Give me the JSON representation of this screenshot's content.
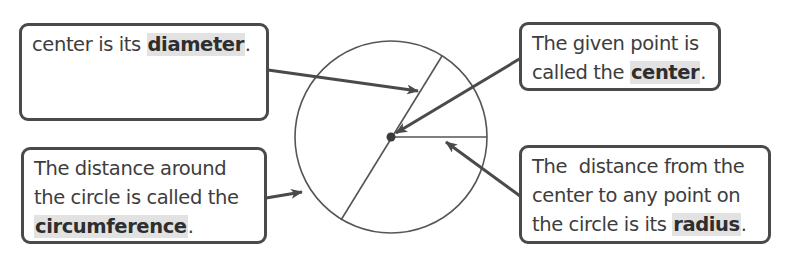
{
  "diagram": {
    "colors": {
      "stroke": "#4a4a4a",
      "highlight": "#e2e2e2",
      "text": "#3d3d3d"
    },
    "circle": {
      "cx": 391,
      "cy": 137,
      "r": 96
    },
    "callouts": {
      "diameter": {
        "lines": [
          "The distance across",
          "the circle through its",
          "center is its "
        ],
        "term": "diameter",
        "end": "."
      },
      "center": {
        "lines": [
          "The given point is",
          "called the "
        ],
        "term": "center",
        "end": "."
      },
      "circumference": {
        "lines": [
          "The distance around",
          "the circle is called the"
        ],
        "term": "circumference",
        "end": "."
      },
      "radius": {
        "lines": [
          "The  distance from the",
          "center to any point on",
          "the circle is its "
        ],
        "term": "radius",
        "end": "."
      }
    }
  }
}
